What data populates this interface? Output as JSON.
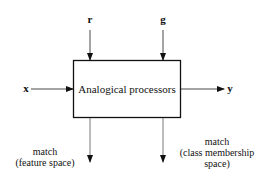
{
  "diagram": {
    "processor": {
      "label": "Analogical processors"
    },
    "inputs": {
      "r": "r",
      "g": "g",
      "x": "x"
    },
    "outputs": {
      "y": "y",
      "match_feature": {
        "line1": "match",
        "line2": "(feature space)"
      },
      "match_class": {
        "line1": "match",
        "line2": "(class membership",
        "line3": "space)"
      }
    },
    "colors": {
      "stroke": "#111111",
      "background": "#ffffff"
    }
  }
}
